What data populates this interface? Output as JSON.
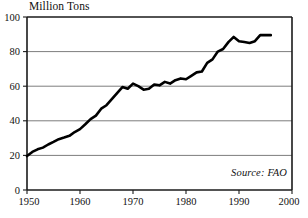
{
  "chart_data": {
    "type": "line",
    "title": "Million Tons",
    "subtitle": "",
    "xlabel": "",
    "ylabel": "Million Tons",
    "xlim": [
      1950,
      2000
    ],
    "ylim": [
      0,
      100
    ],
    "grid": true,
    "legend_position": "none",
    "annotations": [
      {
        "name": "source",
        "text": "Source: FAO",
        "style": "italic",
        "position": "bottom-right-inside"
      }
    ],
    "xticks": [
      1950,
      1960,
      1970,
      1980,
      1990,
      2000
    ],
    "xtick_labels": [
      "1950",
      "1960",
      "1970",
      "1980",
      "1990",
      "2000"
    ],
    "yticks": [
      0,
      20,
      40,
      60,
      80,
      100
    ],
    "ytick_labels": [
      "0",
      "20",
      "40",
      "60",
      "80",
      "100"
    ],
    "series": [
      {
        "name": "World Fish Catch",
        "color": "#000000",
        "line_width": 2.6,
        "x": [
          1950,
          1951,
          1952,
          1953,
          1954,
          1955,
          1956,
          1957,
          1958,
          1959,
          1960,
          1961,
          1962,
          1963,
          1964,
          1965,
          1966,
          1967,
          1968,
          1969,
          1970,
          1971,
          1972,
          1973,
          1974,
          1975,
          1976,
          1977,
          1978,
          1979,
          1980,
          1981,
          1982,
          1983,
          1984,
          1985,
          1986,
          1987,
          1988,
          1989,
          1990,
          1991,
          1992,
          1993,
          1994,
          1995,
          1996
        ],
        "values": [
          19.6,
          22.0,
          23.5,
          24.5,
          26.3,
          27.8,
          29.4,
          30.3,
          31.3,
          33.5,
          35.2,
          38.0,
          41.0,
          43.0,
          47.0,
          49.0,
          52.5,
          56.0,
          59.5,
          58.5,
          61.5,
          60.0,
          58.0,
          58.5,
          61.0,
          60.5,
          62.5,
          61.5,
          63.5,
          64.5,
          64.0,
          66.0,
          68.0,
          68.5,
          73.5,
          75.5,
          80.0,
          81.5,
          85.5,
          88.5,
          86.0,
          85.5,
          85.0,
          86.0,
          89.5,
          89.5,
          89.5
        ]
      }
    ]
  },
  "geometry": {
    "plot_left": 27,
    "plot_right": 292,
    "plot_top": 17,
    "plot_bottom": 190
  },
  "colors": {
    "line": "#000000",
    "grid": "#7d7d7d",
    "frame": "#1a1a1a",
    "background": "#ffffff",
    "text": "#111111"
  }
}
